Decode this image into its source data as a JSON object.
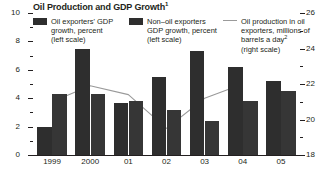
{
  "chart_data": {
    "type": "bar",
    "title": "Oil Production and GDP Growth",
    "title_footnote": "1",
    "xlabel": "",
    "ylabel": "",
    "categories": [
      "1999",
      "2000",
      "01",
      "02",
      "03",
      "04",
      "05"
    ],
    "left_axis": {
      "label": "percent",
      "ylim": [
        0,
        10
      ],
      "ticks": [
        0,
        2,
        4,
        6,
        8,
        10
      ],
      "tick_labels": [
        "0",
        "2",
        "4",
        "6",
        "8",
        "10"
      ],
      "minor_ticks": [
        1,
        3,
        5,
        7,
        9
      ]
    },
    "right_axis": {
      "label": "millions of barrels a day",
      "ylim": [
        18,
        26
      ],
      "ticks": [
        18,
        20,
        22,
        24,
        26
      ],
      "tick_labels": [
        "18",
        "20",
        "22",
        "24",
        "26"
      ],
      "minor_ticks": [
        19,
        21,
        23,
        25
      ]
    },
    "grid": false,
    "legend_position": "top",
    "series": [
      {
        "name": "Oil exporters' GDP growth, percent (left scale)",
        "type": "bar",
        "axis": "left",
        "color": "#2e2e2e",
        "values": [
          2.0,
          7.5,
          3.7,
          5.5,
          7.3,
          6.2,
          5.2
        ]
      },
      {
        "name": "Non-oil exporters GDP growth, percent (left scale)",
        "type": "bar",
        "axis": "left",
        "color": "#363636",
        "values": [
          4.3,
          4.3,
          3.8,
          3.2,
          2.4,
          3.8,
          4.5
        ]
      },
      {
        "name": "Oil production in oil exporters, millions of barrels a day (right scale)",
        "type": "line",
        "axis": "right",
        "color": "#9a9a9a",
        "x": [
          "1999",
          "2000",
          "01",
          "02",
          "03",
          "04"
        ],
        "values": [
          21.0,
          21.9,
          21.4,
          19.5,
          21.2,
          22.0
        ]
      }
    ]
  },
  "legend": {
    "entries": [
      {
        "marker": "swatch",
        "line1": "Oil exporters' GDP",
        "line2": "growth, percent",
        "line3": "(left scale)",
        "footnote": ""
      },
      {
        "marker": "swatch",
        "line1": "Non–oil exporters",
        "line2": "GDP growth, percent",
        "line3": "(left scale)",
        "footnote": ""
      },
      {
        "marker": "line",
        "line1": "Oil production in oil",
        "line2": "exporters, millions of",
        "line3": "barrels a day",
        "line4": "(right scale)",
        "footnote": "2"
      }
    ]
  },
  "colors": {
    "bar_primary": "#2e2e2e",
    "bar_secondary": "#363636",
    "line": "#9a9a9a",
    "axis": "#231f20",
    "background": "#ffffff"
  }
}
